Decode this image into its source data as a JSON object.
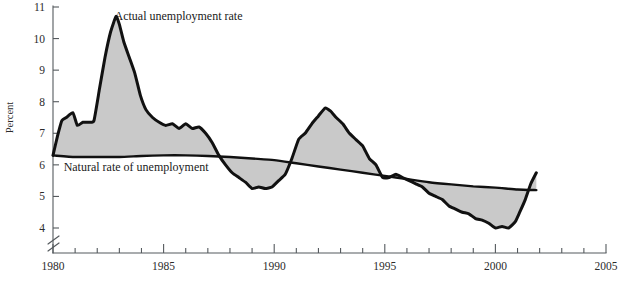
{
  "chart_data": {
    "type": "area",
    "title": "",
    "xlabel": "",
    "ylabel": "Percent",
    "xlim": [
      1980,
      2005
    ],
    "ylim": [
      3.6,
      11
    ],
    "y_axis_break": true,
    "y_break_below": 4,
    "grid": false,
    "legend_position": "inline-annotation",
    "yticks": [
      4,
      5,
      6,
      7,
      8,
      9,
      10,
      11
    ],
    "ytick_labels": [
      "4",
      "5",
      "6",
      "7",
      "8",
      "9",
      "10",
      "11"
    ],
    "xticks": [
      1980,
      1985,
      1990,
      1995,
      2000,
      2005
    ],
    "xtick_labels": [
      "1980",
      "1985",
      "1990",
      "1995",
      "2000",
      "2005"
    ],
    "xtick_minor_step": 1,
    "fill_color": "#c9c9c9",
    "line_color": "#111111",
    "axis_color": "#555a5e",
    "annotations": [
      {
        "name": "actual-series-label",
        "text": "Actual unemployment rate",
        "x": 1982.6,
        "y": 10.72
      },
      {
        "name": "natural-series-label",
        "text": "Natural rate of unemployment",
        "x": 1980.3,
        "y": 5.93
      }
    ],
    "series": [
      {
        "name": "Actual unemployment rate",
        "x": [
          1980.0,
          1980.2,
          1980.4,
          1980.6,
          1980.9,
          1981.1,
          1981.35,
          1981.6,
          1981.85,
          1982.1,
          1982.35,
          1982.6,
          1982.85,
          1983.0,
          1983.2,
          1983.45,
          1983.7,
          1983.95,
          1984.2,
          1984.5,
          1984.8,
          1985.1,
          1985.4,
          1985.7,
          1986.0,
          1986.3,
          1986.6,
          1986.9,
          1987.2,
          1987.5,
          1987.8,
          1988.1,
          1988.4,
          1988.7,
          1989.0,
          1989.3,
          1989.6,
          1989.9,
          1990.2,
          1990.5,
          1990.8,
          1991.1,
          1991.4,
          1991.7,
          1992.0,
          1992.3,
          1992.55,
          1992.8,
          1993.1,
          1993.4,
          1993.7,
          1994.0,
          1994.3,
          1994.6,
          1994.9,
          1995.2,
          1995.5,
          1995.8,
          1996.1,
          1996.4,
          1996.7,
          1997.0,
          1997.3,
          1997.6,
          1997.9,
          1998.2,
          1998.5,
          1998.8,
          1999.1,
          1999.4,
          1999.7,
          2000.0,
          2000.3,
          2000.6,
          2000.9,
          2001.1,
          2001.35,
          2001.6,
          2001.85
        ],
        "y": [
          6.3,
          6.9,
          7.4,
          7.5,
          7.65,
          7.25,
          7.35,
          7.35,
          7.4,
          8.4,
          9.4,
          10.2,
          10.7,
          10.45,
          9.9,
          9.4,
          8.9,
          8.2,
          7.75,
          7.5,
          7.35,
          7.25,
          7.3,
          7.15,
          7.3,
          7.15,
          7.2,
          7.0,
          6.7,
          6.3,
          6.0,
          5.75,
          5.6,
          5.45,
          5.25,
          5.3,
          5.25,
          5.3,
          5.5,
          5.7,
          6.2,
          6.8,
          7.0,
          7.3,
          7.55,
          7.8,
          7.7,
          7.5,
          7.3,
          7.0,
          6.8,
          6.6,
          6.2,
          6.0,
          5.6,
          5.6,
          5.7,
          5.6,
          5.5,
          5.4,
          5.3,
          5.1,
          5.0,
          4.9,
          4.7,
          4.6,
          4.5,
          4.45,
          4.3,
          4.25,
          4.15,
          4.0,
          4.05,
          4.0,
          4.2,
          4.5,
          4.9,
          5.4,
          5.75
        ]
      },
      {
        "name": "Natural rate of unemployment",
        "x": [
          1980.0,
          1981.0,
          1982.0,
          1983.0,
          1984.0,
          1985.0,
          1986.0,
          1987.0,
          1988.0,
          1989.0,
          1990.0,
          1991.0,
          1992.0,
          1993.0,
          1994.0,
          1995.0,
          1996.0,
          1997.0,
          1998.0,
          1999.0,
          2000.0,
          2001.0,
          2001.85
        ],
        "y": [
          6.3,
          6.25,
          6.25,
          6.25,
          6.28,
          6.3,
          6.3,
          6.28,
          6.25,
          6.2,
          6.15,
          6.05,
          5.95,
          5.85,
          5.75,
          5.65,
          5.55,
          5.45,
          5.38,
          5.32,
          5.28,
          5.22,
          5.2
        ]
      }
    ]
  }
}
